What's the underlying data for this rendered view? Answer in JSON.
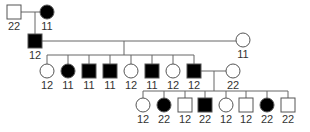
{
  "diagram": {
    "type": "pedigree",
    "colors": {
      "line": "#666666",
      "affected_fill": "#000000",
      "unaffected_fill": "#ffffff",
      "stroke": "#555555",
      "label": "#333333"
    },
    "individuals": [
      {
        "id": "I1",
        "generation": 1,
        "sex": "male",
        "affected": false,
        "label": "22",
        "cx": 14,
        "cy": 12
      },
      {
        "id": "I2",
        "generation": 1,
        "sex": "female",
        "affected": true,
        "label": "11",
        "cx": 47,
        "cy": 12
      },
      {
        "id": "II1",
        "generation": 2,
        "sex": "male",
        "affected": true,
        "label": "12",
        "cx": 35,
        "cy": 41
      },
      {
        "id": "II2",
        "generation": 2,
        "sex": "female",
        "affected": false,
        "label": "11",
        "cx": 243,
        "cy": 40
      },
      {
        "id": "III1",
        "generation": 3,
        "sex": "female",
        "affected": false,
        "label": "12",
        "cx": 47,
        "cy": 71
      },
      {
        "id": "III2",
        "generation": 3,
        "sex": "female",
        "affected": true,
        "label": "11",
        "cx": 68,
        "cy": 71
      },
      {
        "id": "III3",
        "generation": 3,
        "sex": "male",
        "affected": true,
        "label": "11",
        "cx": 89,
        "cy": 71
      },
      {
        "id": "III4",
        "generation": 3,
        "sex": "male",
        "affected": true,
        "label": "11",
        "cx": 110,
        "cy": 71
      },
      {
        "id": "III5",
        "generation": 3,
        "sex": "female",
        "affected": false,
        "label": "12",
        "cx": 131,
        "cy": 71
      },
      {
        "id": "III6",
        "generation": 3,
        "sex": "male",
        "affected": true,
        "label": "11",
        "cx": 152,
        "cy": 71
      },
      {
        "id": "III7",
        "generation": 3,
        "sex": "female",
        "affected": false,
        "label": "12",
        "cx": 173,
        "cy": 71
      },
      {
        "id": "III8",
        "generation": 3,
        "sex": "male",
        "affected": true,
        "label": "12",
        "cx": 194,
        "cy": 71
      },
      {
        "id": "III9",
        "generation": 3,
        "sex": "female",
        "affected": false,
        "label": "22",
        "cx": 233,
        "cy": 71
      },
      {
        "id": "IV1",
        "generation": 4,
        "sex": "female",
        "affected": false,
        "label": "12",
        "cx": 143,
        "cy": 105
      },
      {
        "id": "IV2",
        "generation": 4,
        "sex": "female",
        "affected": true,
        "label": "22",
        "cx": 164,
        "cy": 105
      },
      {
        "id": "IV3",
        "generation": 4,
        "sex": "male",
        "affected": false,
        "label": "12",
        "cx": 185,
        "cy": 105
      },
      {
        "id": "IV4",
        "generation": 4,
        "sex": "male",
        "affected": true,
        "label": "22",
        "cx": 205,
        "cy": 105
      },
      {
        "id": "IV5",
        "generation": 4,
        "sex": "female",
        "affected": false,
        "label": "12",
        "cx": 226,
        "cy": 105
      },
      {
        "id": "IV6",
        "generation": 4,
        "sex": "male",
        "affected": false,
        "label": "12",
        "cx": 246,
        "cy": 105
      },
      {
        "id": "IV7",
        "generation": 4,
        "sex": "female",
        "affected": true,
        "label": "22",
        "cx": 267,
        "cy": 105
      },
      {
        "id": "IV8",
        "generation": 4,
        "sex": "male",
        "affected": false,
        "label": "22",
        "cx": 288,
        "cy": 105
      }
    ],
    "lines": [
      {
        "x1": 21,
        "y1": 12,
        "x2": 40,
        "y2": 12
      },
      {
        "x1": 35,
        "y1": 12,
        "x2": 35,
        "y2": 34
      },
      {
        "x1": 42,
        "y1": 41,
        "x2": 236,
        "y2": 41
      },
      {
        "x1": 124,
        "y1": 41,
        "x2": 124,
        "y2": 55
      },
      {
        "x1": 47,
        "y1": 55,
        "x2": 194,
        "y2": 55
      },
      {
        "x1": 47,
        "y1": 55,
        "x2": 47,
        "y2": 64
      },
      {
        "x1": 68,
        "y1": 55,
        "x2": 68,
        "y2": 64
      },
      {
        "x1": 89,
        "y1": 55,
        "x2": 89,
        "y2": 64
      },
      {
        "x1": 110,
        "y1": 55,
        "x2": 110,
        "y2": 64
      },
      {
        "x1": 131,
        "y1": 55,
        "x2": 131,
        "y2": 64
      },
      {
        "x1": 152,
        "y1": 55,
        "x2": 152,
        "y2": 64
      },
      {
        "x1": 173,
        "y1": 55,
        "x2": 173,
        "y2": 64
      },
      {
        "x1": 194,
        "y1": 55,
        "x2": 194,
        "y2": 64
      },
      {
        "x1": 201,
        "y1": 71,
        "x2": 226,
        "y2": 71
      },
      {
        "x1": 214,
        "y1": 71,
        "x2": 214,
        "y2": 91
      },
      {
        "x1": 143,
        "y1": 91,
        "x2": 288,
        "y2": 91
      },
      {
        "x1": 143,
        "y1": 91,
        "x2": 143,
        "y2": 98
      },
      {
        "x1": 164,
        "y1": 91,
        "x2": 164,
        "y2": 98
      },
      {
        "x1": 185,
        "y1": 91,
        "x2": 185,
        "y2": 98
      },
      {
        "x1": 205,
        "y1": 91,
        "x2": 205,
        "y2": 98
      },
      {
        "x1": 226,
        "y1": 91,
        "x2": 226,
        "y2": 98
      },
      {
        "x1": 246,
        "y1": 91,
        "x2": 246,
        "y2": 98
      },
      {
        "x1": 267,
        "y1": 91,
        "x2": 267,
        "y2": 98
      },
      {
        "x1": 288,
        "y1": 91,
        "x2": 288,
        "y2": 98
      }
    ]
  }
}
